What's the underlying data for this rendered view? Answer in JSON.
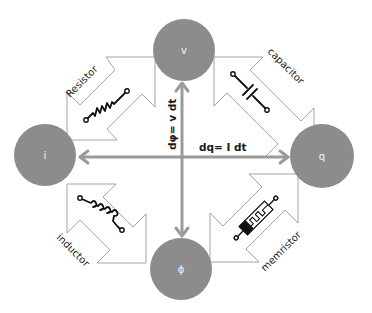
{
  "diagram": {
    "colors": {
      "node_fill": "#8c8c8c",
      "arrow_stroke": "#9a9a9a",
      "axis": "#9a9a9a",
      "text": "#1a1a1a"
    },
    "nodes": {
      "v": {
        "label": "v"
      },
      "i": {
        "label": "i"
      },
      "q": {
        "label": "q"
      },
      "phi": {
        "label": "ϕ"
      }
    },
    "relations": {
      "vertical": "dφ= v dt",
      "horizontal": "dq= I dt"
    },
    "components": [
      {
        "id": "resistor",
        "label": "Resistor",
        "connects": [
          "i",
          "v"
        ],
        "icon": "resistor-icon"
      },
      {
        "id": "capacitor",
        "label": "capacitor",
        "connects": [
          "v",
          "q"
        ],
        "icon": "capacitor-icon"
      },
      {
        "id": "inductor",
        "label": "inductor",
        "connects": [
          "i",
          "phi"
        ],
        "icon": "inductor-icon"
      },
      {
        "id": "memristor",
        "label": "memristor",
        "connects": [
          "phi",
          "q"
        ],
        "icon": "memristor-icon"
      }
    ]
  }
}
